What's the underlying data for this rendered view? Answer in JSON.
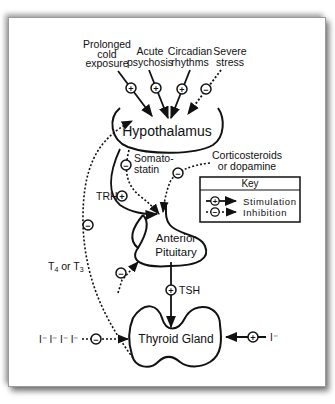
{
  "diagram": {
    "inputs": [
      {
        "label_lines": [
          "Prolonged",
          "cold",
          "exposure"
        ],
        "effect": "stimulation",
        "sign": "+"
      },
      {
        "label_lines": [
          "Acute",
          "psychosis"
        ],
        "effect": "stimulation",
        "sign": "+"
      },
      {
        "label_lines": [
          "Circadian",
          "rhythms"
        ],
        "effect": "stimulation",
        "sign": "+"
      },
      {
        "label_lines": [
          "Severe",
          "stress"
        ],
        "effect": "inhibition",
        "sign": "−"
      }
    ],
    "nodes": {
      "hypothalamus": "Hypothalamus",
      "anterior_pituitary_line1": "Anterior",
      "anterior_pituitary_line2": "Pituitary",
      "thyroid_gland": "Thyroid  Gland"
    },
    "edges": {
      "trh": {
        "label": "TRH",
        "sign": "+",
        "effect": "stimulation"
      },
      "somatostatin": {
        "label_line1": "Somato-",
        "label_line2": "statin",
        "sign": "−",
        "effect": "inhibition"
      },
      "corticosteroids": {
        "label_line1": "Corticosteroids",
        "label_line2": "or dopamine",
        "sign": "−",
        "effect": "inhibition"
      },
      "tsh": {
        "label": "TSH",
        "sign": "+",
        "effect": "stimulation"
      },
      "t4_t3_feedback": {
        "label_main": "T",
        "sub1": "4",
        "mid": " or T",
        "sub2": "3",
        "sign": "−",
        "effect": "inhibition"
      },
      "iodide_excess": {
        "label": "I⁻ I⁻ I⁻ I⁻",
        "sign": "−",
        "effect": "inhibition"
      },
      "iodide": {
        "label": "I⁻",
        "sign": "+",
        "effect": "stimulation"
      }
    },
    "key": {
      "title": "Key",
      "items": [
        {
          "label": "Stimulation",
          "sign": "+"
        },
        {
          "label": "Inhibition",
          "sign": "−"
        }
      ]
    },
    "colors": {
      "ink": "#111111",
      "background": "#ffffff"
    }
  }
}
